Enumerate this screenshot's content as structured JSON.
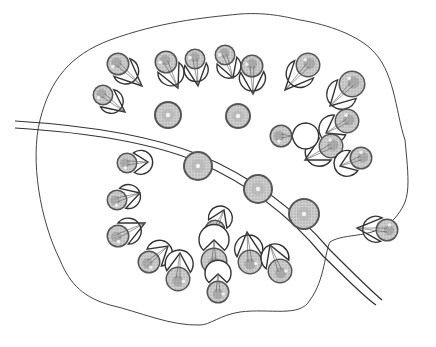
{
  "figure": {
    "stroke_color": "#333333",
    "cell_fill": "#cfcfcf",
    "outline_path": "M60,260 C40,220 30,160 40,120 C50,80 70,55 110,40 C160,22 200,18 240,14 C270,12 290,18 300,20 C330,25 355,35 370,48 C395,70 395,110 405,140 C410,190 410,200 395,218 C375,240 345,232 330,242 C325,250 325,280 310,300 C300,318 270,308 240,312 C220,315 210,325 200,325 C170,326 140,312 110,305 C85,298 70,285 60,260 Z",
    "fiber": {
      "outer": "M15,121 C80,125 150,135 200,155 C260,180 300,215 330,250 C355,275 370,290 382,300",
      "inner": "M15,128 C80,132 150,142 198,162 C255,187 295,222 323,256 C348,280 363,296 376,305"
    },
    "round_cells": [
      {
        "cx": 168,
        "cy": 115,
        "r": 14
      },
      {
        "cx": 238,
        "cy": 116,
        "r": 13
      },
      {
        "cx": 198,
        "cy": 166,
        "r": 15
      },
      {
        "cx": 258,
        "cy": 189,
        "r": 15
      },
      {
        "cx": 304,
        "cy": 214,
        "r": 16
      }
    ],
    "pear_cells": [
      {
        "cx": 118,
        "cy": 64,
        "r": 13,
        "tip_x": 142,
        "tip_y": 86
      },
      {
        "cx": 166,
        "cy": 62,
        "r": 13,
        "tip_x": 178,
        "tip_y": 88
      },
      {
        "cx": 195,
        "cy": 59,
        "r": 12,
        "tip_x": 198,
        "tip_y": 86
      },
      {
        "cx": 225,
        "cy": 55,
        "r": 12,
        "tip_x": 233,
        "tip_y": 78
      },
      {
        "cx": 252,
        "cy": 66,
        "r": 13,
        "tip_x": 253,
        "tip_y": 94
      },
      {
        "cx": 103,
        "cy": 95,
        "r": 12,
        "tip_x": 125,
        "tip_y": 112
      },
      {
        "cx": 308,
        "cy": 65,
        "r": 14,
        "tip_x": 285,
        "tip_y": 90
      },
      {
        "cx": 352,
        "cy": 84,
        "r": 15,
        "tip_x": 330,
        "tip_y": 106
      },
      {
        "cx": 347,
        "cy": 121,
        "r": 14,
        "tip_x": 326,
        "tip_y": 133
      },
      {
        "cx": 331,
        "cy": 146,
        "r": 14,
        "tip_x": 305,
        "tip_y": 160
      },
      {
        "cx": 361,
        "cy": 158,
        "r": 13,
        "tip_x": 340,
        "tip_y": 166
      },
      {
        "cx": 348,
        "cy": 128,
        "r": 1,
        "tip_x": 348,
        "tip_y": 128
      },
      {
        "cx": 281,
        "cy": 136,
        "r": 13,
        "tip_x": 292,
        "tip_y": 136
      },
      {
        "cx": 127,
        "cy": 163,
        "r": 12,
        "tip_x": 148,
        "tip_y": 162
      },
      {
        "cx": 117,
        "cy": 200,
        "r": 12,
        "tip_x": 140,
        "tip_y": 193
      },
      {
        "cx": 118,
        "cy": 236,
        "r": 13,
        "tip_x": 145,
        "tip_y": 223
      },
      {
        "cx": 149,
        "cy": 262,
        "r": 13,
        "tip_x": 168,
        "tip_y": 246
      },
      {
        "cx": 178,
        "cy": 279,
        "r": 14,
        "tip_x": 180,
        "tip_y": 253
      },
      {
        "cx": 215,
        "cy": 230,
        "r": 12,
        "tip_x": 224,
        "tip_y": 210
      },
      {
        "cx": 214,
        "cy": 261,
        "r": 15,
        "tip_x": 214,
        "tip_y": 240
      },
      {
        "cx": 218,
        "cy": 292,
        "r": 13,
        "tip_x": 218,
        "tip_y": 274
      },
      {
        "cx": 250,
        "cy": 262,
        "r": 14,
        "tip_x": 247,
        "tip_y": 232
      },
      {
        "cx": 280,
        "cy": 271,
        "r": 14,
        "tip_x": 270,
        "tip_y": 245
      },
      {
        "cx": 387,
        "cy": 230,
        "r": 13,
        "tip_x": 357,
        "tip_y": 228
      }
    ]
  },
  "caption": {
    "text": "(caption text cut off / illegible)"
  }
}
